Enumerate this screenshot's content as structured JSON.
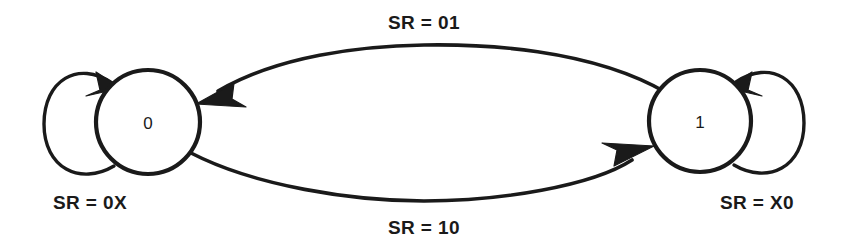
{
  "diagram": {
    "type": "state-transition-diagram",
    "title": "",
    "background_color": "#ffffff",
    "stroke_color": "#1a1a1a",
    "states": [
      {
        "id": "state-0",
        "label": "0",
        "cx": 148,
        "cy": 122,
        "r": 52
      },
      {
        "id": "state-1",
        "label": "1",
        "cx": 700,
        "cy": 121,
        "r": 51
      }
    ],
    "transitions": [
      {
        "id": "self-loop-0",
        "kind": "self-loop",
        "from": "state-0",
        "to": "state-0",
        "label": "SR = 0X",
        "label_x": 90,
        "label_y": 202,
        "side": "left"
      },
      {
        "id": "arc-0-to-1",
        "kind": "arc",
        "from": "state-0",
        "to": "state-1",
        "label": "SR = 10",
        "label_x": 424,
        "label_y": 227,
        "side": "bottom"
      },
      {
        "id": "arc-1-to-0",
        "kind": "arc",
        "from": "state-1",
        "to": "state-0",
        "label": "SR = 01",
        "label_x": 424,
        "label_y": 22,
        "side": "top"
      },
      {
        "id": "self-loop-1",
        "kind": "self-loop",
        "from": "state-1",
        "to": "state-1",
        "label": "SR = X0",
        "label_x": 757,
        "label_y": 202,
        "side": "right"
      }
    ]
  }
}
